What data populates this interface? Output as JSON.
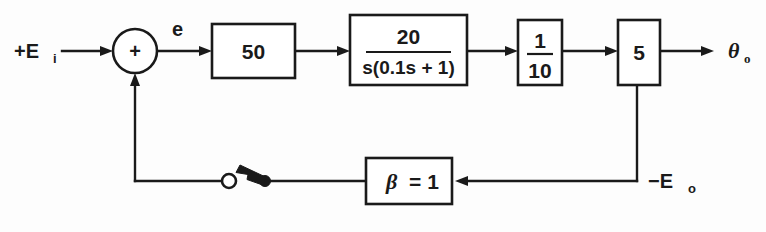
{
  "diagram": {
    "type": "control-system-block-diagram",
    "stroke_color": "#1a1a1a",
    "background_color": "#fdfdfd",
    "input": {
      "label_main": "+E",
      "label_sub": "i"
    },
    "error_signal": {
      "label": "e"
    },
    "summing_junction": {
      "sign": "+"
    },
    "blocks": [
      {
        "name": "gain-50",
        "label": "50"
      },
      {
        "name": "plant-transfer-function",
        "numerator": "20",
        "denominator": "s(0.1s + 1)"
      },
      {
        "name": "gain-one-tenth",
        "numerator": "1",
        "denominator": "10"
      },
      {
        "name": "gain-5",
        "label": "5"
      },
      {
        "name": "feedback-gain-beta",
        "symbol": "β",
        "equals": "= 1"
      }
    ],
    "output": {
      "label_main": "θ",
      "label_sub": "o"
    },
    "feedback_signal": {
      "label_main": "−E",
      "label_sub": "o"
    },
    "switch": {
      "name": "feedback-switch",
      "state": "open"
    }
  }
}
